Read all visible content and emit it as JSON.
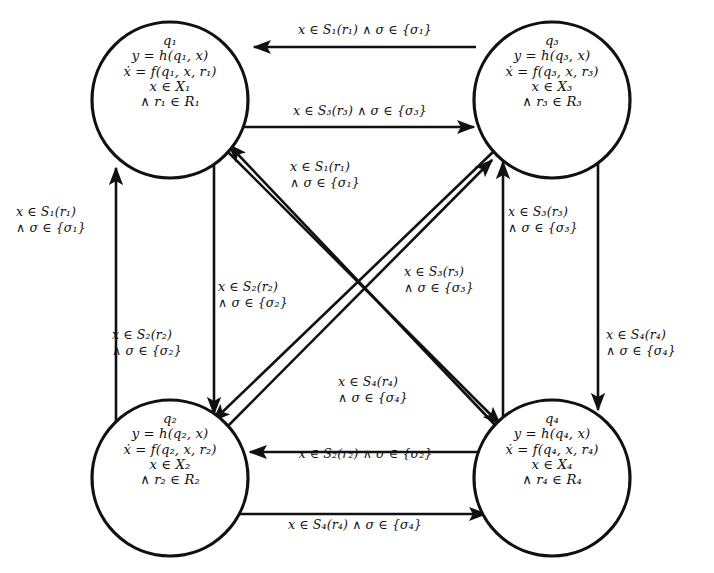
{
  "diagram": {
    "type": "state-transition-graph",
    "stroke_color": "#111111",
    "background_color": "#ffffff",
    "nodes": [
      {
        "id": "q1",
        "position": "top-left",
        "cx": 170,
        "cy": 100,
        "r": 78,
        "lines": [
          "q₁",
          "y = h(q₁, x)",
          "ẋ = f(q₁, x, r₁)",
          "x ∈ X₁",
          "∧ r₁ ∈ R₁"
        ]
      },
      {
        "id": "q3",
        "position": "top-right",
        "cx": 552,
        "cy": 100,
        "r": 78,
        "lines": [
          "q₃",
          "y = h(q₃, x)",
          "ẋ = f(q₃, x, r₃)",
          "x ∈ X₃",
          "∧ r₃ ∈ R₃"
        ]
      },
      {
        "id": "q2",
        "position": "bottom-left",
        "cx": 170,
        "cy": 478,
        "r": 78,
        "lines": [
          "q₂",
          "y = h(q₂, x)",
          "ẋ = f(q₂, x, r₂)",
          "x ∈ X₂",
          "∧ r₂ ∈ R₂"
        ]
      },
      {
        "id": "q4",
        "position": "bottom-right",
        "cx": 552,
        "cy": 478,
        "r": 78,
        "lines": [
          "q₄",
          "y = h(q₄, x)",
          "ẋ = f(q₄, x, r₄)",
          "x ∈ X₄",
          "∧ r₄ ∈ R₄"
        ]
      }
    ],
    "edges": [
      {
        "id": "e-q3-q1-top",
        "from": "q3",
        "to": "q1",
        "direction": "left",
        "style": "straight-horizontal",
        "lines": [
          "x ∈ S₁(r₁) ∧ σ ∈ {σ₁}"
        ]
      },
      {
        "id": "e-q1-q3-top",
        "from": "q1",
        "to": "q3",
        "direction": "right",
        "style": "straight-horizontal",
        "lines": [
          "x ∈ S₃(r₃) ∧ σ ∈ {σ₃}"
        ]
      },
      {
        "id": "e-q4-q2-bottom",
        "from": "q4",
        "to": "q2",
        "direction": "left",
        "style": "straight-horizontal",
        "lines": [
          "x ∈ S₂(r₂) ∧ σ ∈ {σ₂}"
        ]
      },
      {
        "id": "e-q2-q4-bottom",
        "from": "q2",
        "to": "q4",
        "direction": "right",
        "style": "straight-horizontal",
        "lines": [
          "x ∈ S₄(r₄) ∧ σ ∈ {σ₄}"
        ]
      },
      {
        "id": "e-q2-q1-left",
        "from": "q2",
        "to": "q1",
        "direction": "up",
        "style": "straight-vertical",
        "lines": [
          "x ∈ S₁(r₁)",
          "∧ σ ∈ {σ₁}"
        ]
      },
      {
        "id": "e-q1-q2-left",
        "from": "q1",
        "to": "q2",
        "direction": "down",
        "style": "straight-vertical",
        "lines": [
          "x ∈ S₂(r₂)",
          "∧ σ ∈ {σ₂}"
        ]
      },
      {
        "id": "e-q4-q3-right",
        "from": "q4",
        "to": "q3",
        "direction": "up",
        "style": "straight-vertical",
        "lines": [
          "x ∈ S₃(r₃)",
          "∧ σ ∈ {σ₃}"
        ]
      },
      {
        "id": "e-q3-q4-right",
        "from": "q3",
        "to": "q4",
        "direction": "down",
        "style": "straight-vertical",
        "lines": [
          "x ∈ S₄(r₄)",
          "∧ σ ∈ {σ₄}"
        ]
      },
      {
        "id": "e-q4-q1-diagonal",
        "from": "q4",
        "to": "q1",
        "direction": "up-left",
        "style": "diagonal",
        "lines": [
          "x ∈ S₁(r₁)",
          "∧ σ ∈ {σ₁}"
        ]
      },
      {
        "id": "e-q3-q2-diagonal",
        "from": "q3",
        "to": "q2",
        "direction": "down-left",
        "style": "diagonal",
        "lines": [
          "x ∈ S₂(r₂)",
          "∧ σ ∈ {σ₂}"
        ]
      },
      {
        "id": "e-q2-q3-diagonal",
        "from": "q2",
        "to": "q3",
        "direction": "up-right",
        "style": "diagonal",
        "lines": [
          "x ∈ S₃(r₃)",
          "∧ σ ∈ {σ₃}"
        ]
      },
      {
        "id": "e-q1-q4-diagonal",
        "from": "q1",
        "to": "q4",
        "direction": "down-right",
        "style": "diagonal",
        "lines": [
          "x ∈ S₄(r₄)",
          "∧ σ ∈ {σ₄}"
        ]
      }
    ]
  }
}
